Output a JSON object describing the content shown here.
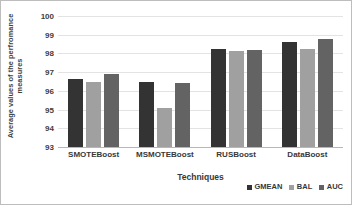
{
  "chart_data": {
    "type": "bar",
    "title": "",
    "categories": [
      "SMOTEBoost",
      "MSMOTEBoost",
      "RUSBoost",
      "DataBoost"
    ],
    "series": [
      {
        "name": "GMEAN",
        "color": "#333333",
        "values": [
          96.65,
          96.5,
          98.25,
          98.6
        ]
      },
      {
        "name": "BAL",
        "color": "#a0a0a0",
        "values": [
          96.45,
          95.1,
          98.15,
          98.25
        ]
      },
      {
        "name": "AUC",
        "color": "#636363",
        "values": [
          96.9,
          96.4,
          98.2,
          98.75
        ]
      }
    ],
    "xlabel": "Techniques",
    "ylabel": "Average values of the perfromance measures",
    "ylabel_line1": "Average values of the perfromance",
    "ylabel_line2": "measures",
    "ylim": [
      93,
      100
    ],
    "yticks": [
      100,
      99,
      98,
      97,
      96,
      95,
      94,
      93
    ],
    "ytick_labels": [
      "100",
      "99",
      "98",
      "97",
      "96",
      "95",
      "94",
      "93"
    ],
    "grid": true,
    "legend_position": "bottom-right"
  }
}
